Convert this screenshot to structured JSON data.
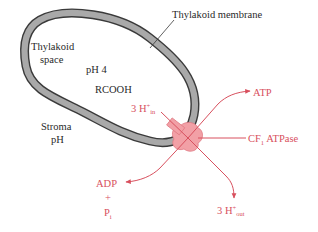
{
  "diagram": {
    "labels": {
      "membrane": "Thylakoid membrane",
      "space_line1": "Thylakoid",
      "space_line2": "space",
      "ph_inside": "pH 4",
      "acid": "RCOOH",
      "h_in_main": "3 H",
      "h_in_sup": "+",
      "h_in_sub": "in",
      "stroma_line1": "Stroma",
      "stroma_line2": "pH",
      "atp": "ATP",
      "atpase_prefix": "CF",
      "atpase_sub": "1",
      "atpase_suffix": " ATPase",
      "adp": "ADP",
      "plus": "+",
      "pi_main": "P",
      "pi_sub": "i",
      "h_out_main": "3 H",
      "h_out_sup": "+",
      "h_out_sub": "out"
    },
    "colors": {
      "membrane_fill": "#a9a9a9",
      "membrane_edge": "#3a3a3a",
      "accent_red": "#d8505e",
      "enzyme_fill": "#f2a0a6",
      "text": "#2a2a2a"
    }
  }
}
